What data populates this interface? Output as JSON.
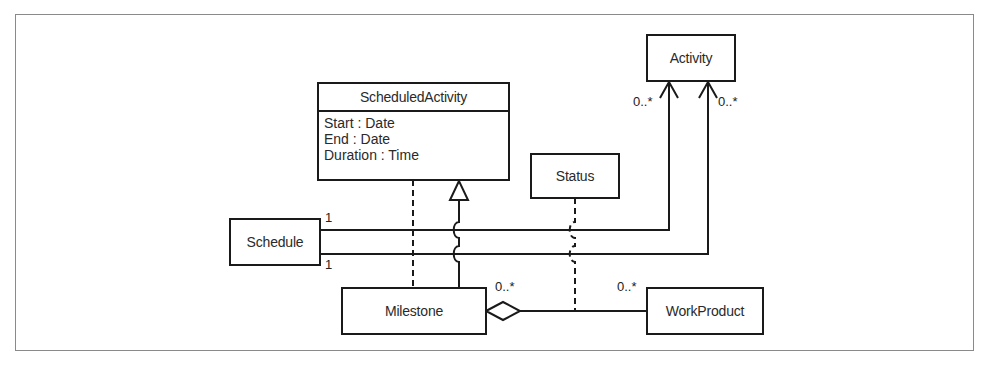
{
  "diagram": {
    "type": "UML class diagram",
    "classes": {
      "scheduled_activity": {
        "name": "ScheduledActivity",
        "attributes": [
          "Start : Date",
          "End : Date",
          "Duration : Time"
        ]
      },
      "activity": {
        "name": "Activity"
      },
      "status": {
        "name": "Status"
      },
      "schedule": {
        "name": "Schedule"
      },
      "milestone": {
        "name": "Milestone"
      },
      "work_product": {
        "name": "WorkProduct"
      }
    },
    "multiplicities": {
      "schedule_top": "1",
      "schedule_bottom": "1",
      "activity_left": "0..*",
      "activity_right": "0..*",
      "milestone_aggregation": "0..*",
      "work_product": "0..*"
    },
    "relationships": [
      {
        "from": "Milestone",
        "to": "ScheduledActivity",
        "kind": "generalization"
      },
      {
        "from": "Milestone",
        "to": "ScheduledActivity",
        "kind": "dashed-dependency"
      },
      {
        "from": "Schedule",
        "to": "Activity",
        "kind": "association",
        "source_mult": "1",
        "target_mult": "0..*"
      },
      {
        "from": "Schedule",
        "to": "Activity",
        "kind": "association",
        "source_mult": "1",
        "target_mult": "0..*"
      },
      {
        "from": "Milestone",
        "to": "WorkProduct",
        "kind": "aggregation",
        "source_mult": "0..*",
        "target_mult": "0..*"
      },
      {
        "from": "Status",
        "to": "Milestone-WorkProduct",
        "kind": "association-class"
      }
    ],
    "colors": {
      "line": "#1a1a1a",
      "frame": "#8a8a8a",
      "text": "#2a2a2a",
      "background": "#ffffff"
    }
  }
}
